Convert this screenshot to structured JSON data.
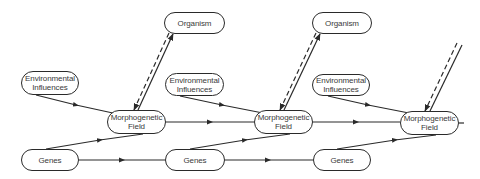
{
  "diagram": {
    "type": "flow",
    "colors": {
      "line": "#2a2a2a",
      "text": "#3a3a3a",
      "background": "#ffffff"
    },
    "nodes": {
      "organism_1": {
        "label": "Organism"
      },
      "organism_2": {
        "label": "Organism"
      },
      "organism_3": {
        "label": "Organism"
      },
      "env_1": {
        "line1": "Environmental",
        "line2": "Influences"
      },
      "env_2": {
        "line1": "Environmental",
        "line2": "Influences"
      },
      "env_3": {
        "line1": "Environmental",
        "line2": "Influences"
      },
      "morph_1": {
        "line1": "Morphogenetic",
        "line2": "Field"
      },
      "morph_2": {
        "line1": "Morphogenetic",
        "line2": "Field"
      },
      "morph_3": {
        "line1": "Morphogenetic",
        "line2": "Field"
      },
      "genes_1": {
        "label": "Genes"
      },
      "genes_2": {
        "label": "Genes"
      },
      "genes_3": {
        "label": "Genes"
      }
    },
    "edges": [
      {
        "from": "env_1",
        "to": "morph_1",
        "style": "solid"
      },
      {
        "from": "genes_1",
        "to": "morph_1",
        "style": "solid"
      },
      {
        "from": "morph_1",
        "to": "organism_1",
        "style": "solid"
      },
      {
        "from": "organism_1",
        "to": "morph_1",
        "style": "dashed"
      },
      {
        "from": "morph_1",
        "to": "morph_2",
        "style": "solid"
      },
      {
        "from": "genes_1",
        "to": "genes_2",
        "style": "solid"
      },
      {
        "from": "env_2",
        "to": "morph_2",
        "style": "solid"
      },
      {
        "from": "genes_2",
        "to": "morph_2",
        "style": "solid"
      },
      {
        "from": "morph_2",
        "to": "organism_2",
        "style": "solid"
      },
      {
        "from": "organism_2",
        "to": "morph_2",
        "style": "dashed"
      },
      {
        "from": "morph_2",
        "to": "morph_3",
        "style": "solid"
      },
      {
        "from": "genes_2",
        "to": "genes_3",
        "style": "solid"
      },
      {
        "from": "env_3",
        "to": "morph_3",
        "style": "solid"
      },
      {
        "from": "genes_3",
        "to": "morph_3",
        "style": "solid"
      },
      {
        "from": "morph_3",
        "to": "offscreen",
        "style": "solid"
      },
      {
        "from": "offscreen",
        "to": "morph_3",
        "style": "dashed"
      }
    ]
  }
}
